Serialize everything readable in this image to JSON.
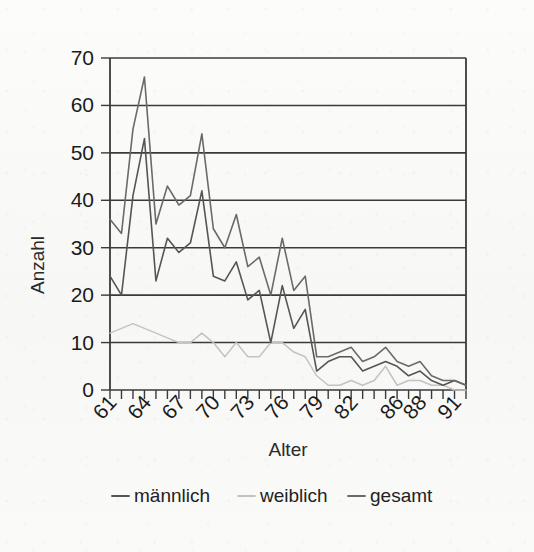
{
  "chart_data": {
    "type": "line",
    "title": "",
    "xlabel": "Alter",
    "ylabel": "Anzahl",
    "xlim": [
      61,
      92
    ],
    "ylim": [
      0,
      70
    ],
    "ytick_values": [
      0,
      10,
      20,
      30,
      40,
      50,
      60,
      70
    ],
    "ytick_labels": [
      "0",
      "10",
      "20",
      "30",
      "40",
      "50",
      "60",
      "70"
    ],
    "xtick_labels": [
      "61",
      "64",
      "67",
      "70",
      "73",
      "76",
      "79",
      "82",
      "86",
      "88",
      "91"
    ],
    "xtick_label_values": [
      61,
      64,
      67,
      70,
      73,
      76,
      79,
      82,
      86,
      88,
      91
    ],
    "x": [
      61,
      62,
      63,
      64,
      65,
      66,
      67,
      68,
      69,
      70,
      71,
      72,
      73,
      74,
      75,
      76,
      77,
      78,
      79,
      80,
      81,
      82,
      83,
      84,
      85,
      86,
      87,
      88,
      89,
      90,
      91,
      92
    ],
    "grid": "horizontal",
    "legend_position": "bottom",
    "series": [
      {
        "name": "männlich",
        "color": "#555555",
        "values": [
          24,
          20,
          41,
          53,
          23,
          32,
          29,
          31,
          42,
          24,
          23,
          27,
          19,
          21,
          10,
          22,
          13,
          17,
          4,
          6,
          7,
          7,
          4,
          5,
          6,
          5,
          3,
          4,
          2,
          1,
          2,
          1
        ]
      },
      {
        "name": "weiblich",
        "color": "#c3c3c3",
        "values": [
          12,
          13,
          14,
          13,
          12,
          11,
          10,
          10,
          12,
          10,
          7,
          10,
          7,
          7,
          10,
          10,
          8,
          7,
          3,
          1,
          1,
          2,
          1,
          2,
          5,
          1,
          2,
          2,
          1,
          1,
          0,
          0
        ]
      },
      {
        "name": "gesamt",
        "color": "#6a6a6a",
        "values": [
          36,
          33,
          55,
          66,
          35,
          43,
          39,
          41,
          54,
          34,
          30,
          37,
          26,
          28,
          20,
          32,
          21,
          24,
          7,
          7,
          8,
          9,
          6,
          7,
          9,
          6,
          5,
          6,
          3,
          2,
          2,
          1
        ]
      }
    ]
  },
  "legend": {
    "items": [
      {
        "label": "männlich",
        "color": "#555555"
      },
      {
        "label": "weiblich",
        "color": "#c3c3c3"
      },
      {
        "label": "gesamt",
        "color": "#6a6a6a"
      }
    ]
  },
  "axes": {
    "x_title": "Alter",
    "y_title": "Anzahl"
  }
}
